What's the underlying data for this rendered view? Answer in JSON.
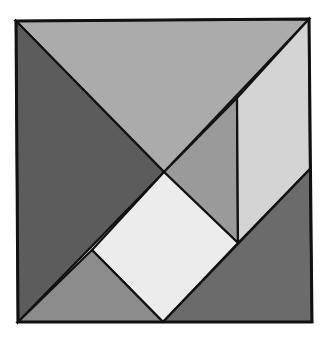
{
  "diagram": {
    "title": "",
    "type": "tangram-square",
    "canvas": {
      "width": 328,
      "height": 339
    },
    "outline": {
      "points": "16,21 309,19 312,322 18,322",
      "stroke": "#111111"
    },
    "pieces": [
      {
        "id": "large-triangle-top",
        "shape": "triangle",
        "points": "16,21 309,19 164,172",
        "fill": "#ababab"
      },
      {
        "id": "large-triangle-left",
        "shape": "triangle",
        "points": "16,21 164,172 18,322",
        "fill": "#5c5c5c"
      },
      {
        "id": "small-triangle-middle",
        "shape": "triangle",
        "points": "164,172 237,98 238,243",
        "fill": "#9a9a9a"
      },
      {
        "id": "parallelogram-right",
        "shape": "parallelogram",
        "points": "237,98 309,19 310,169 238,243",
        "fill": "#d4d4d4"
      },
      {
        "id": "square-center",
        "shape": "square",
        "points": "164,172 238,243 163,322 92,250",
        "fill": "#ececec"
      },
      {
        "id": "small-triangle-bottom-left",
        "shape": "triangle",
        "points": "92,250 163,322 18,322",
        "fill": "#8c8c8c"
      },
      {
        "id": "medium-triangle-bottom-right",
        "shape": "triangle",
        "points": "310,169 312,322 163,322",
        "fill": "#6b6b6b"
      }
    ]
  }
}
